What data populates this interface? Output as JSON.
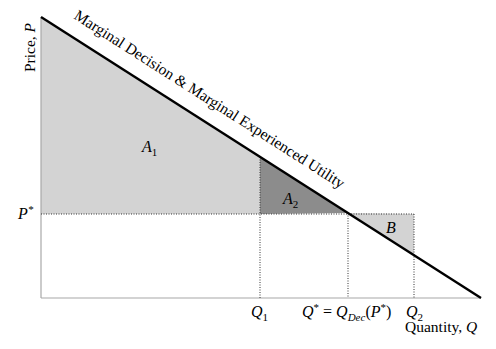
{
  "diagram": {
    "type": "economics-utility-diagram",
    "axes": {
      "y_label": "Price, ",
      "y_label_var": "P",
      "x_label": "Quantity, ",
      "x_label_var": "Q"
    },
    "curve_label": "Marginal Decision & Marginal Experienced Utility",
    "price_marker": {
      "symbol": "P",
      "sup": "*"
    },
    "quantity_markers": {
      "q1": {
        "symbol": "Q",
        "sub": "1"
      },
      "qstar": {
        "lhs": "Q",
        "lhs_sup": "*",
        "eq": " = ",
        "rhs": "Q",
        "rhs_sub": "Dec",
        "paren_open": "(",
        "arg": "P",
        "arg_sup": "*",
        "paren_close": ")"
      },
      "q2": {
        "symbol": "Q",
        "sub": "2"
      }
    },
    "regions": [
      {
        "id": "A1",
        "label": "A",
        "sub": "1",
        "fill": "#d3d3d3"
      },
      {
        "id": "A2",
        "label": "A",
        "sub": "2",
        "fill": "#8c8c8c"
      },
      {
        "id": "B",
        "label": "B",
        "sub": "",
        "fill": "#d3d3d3"
      }
    ],
    "colors": {
      "line": "#000000",
      "axis": "#a8a8a8",
      "dotted": "#333333"
    }
  }
}
